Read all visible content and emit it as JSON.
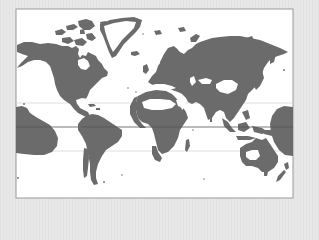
{
  "map": {
    "title": "World map",
    "projection": "Mercator-style world map",
    "colors": {
      "background": "#e5e5e5",
      "frame_border": "#9a9a9a",
      "ocean": "#ffffff",
      "land": "#6b6b6b",
      "tropic_lines": "#d4d4d4",
      "equator_line": "#555555"
    },
    "lines": [
      {
        "name": "tropic-of-cancer",
        "y": 103
      },
      {
        "name": "equator",
        "y": 127
      },
      {
        "name": "tropic-of-capricorn",
        "y": 151
      }
    ],
    "regions": [
      "north-america",
      "greenland",
      "south-america",
      "europe-asia",
      "africa",
      "australia",
      "pacific-region-west",
      "pacific-region-east",
      "new-zealand",
      "madagascar",
      "southeast-asia-islands",
      "arctic-islands"
    ]
  }
}
